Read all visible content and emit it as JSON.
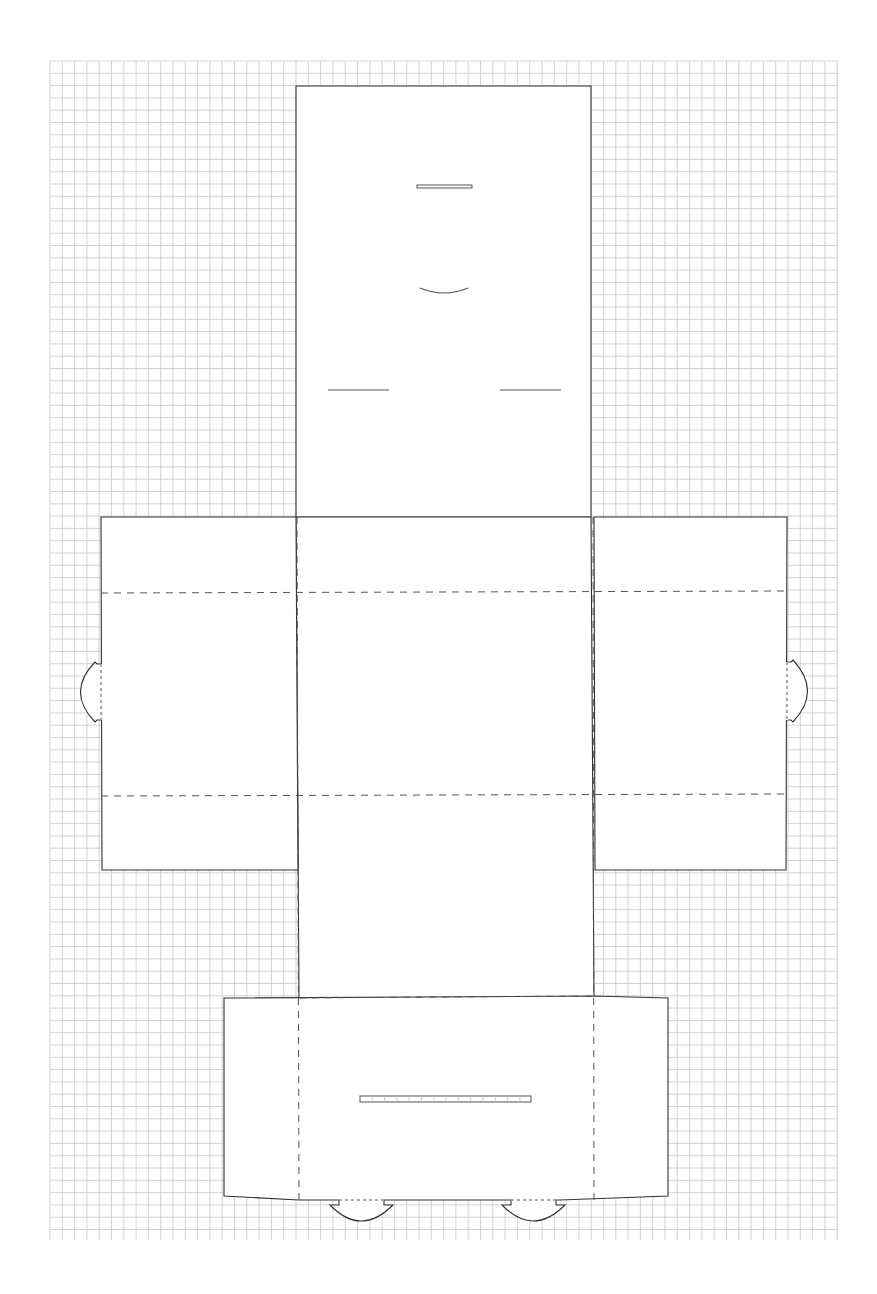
{
  "sheet": {
    "background": "#ffffff",
    "grid": {
      "x0": 50,
      "y0": 61,
      "x1": 838,
      "y1": 1240,
      "cell": 12.3,
      "color": "#c8c8c8"
    },
    "line_color": "#333333"
  },
  "die_line": {
    "panels": [
      {
        "name": "top-lid-panel",
        "points": "296,86 591,86 591,517 296,517"
      },
      {
        "name": "center-body-panel",
        "points": "296,517 591,517 594,998 299,998"
      },
      {
        "name": "left-side-panel",
        "points": "101,517 296,517 298,870 102,870"
      },
      {
        "name": "right-side-panel",
        "points": "594,517 787,517 786,870 595,870"
      },
      {
        "name": "bottom-front-panel",
        "points": "224,998 594,996 668,998 668,1196 560,1200 299,1200 224,1196"
      }
    ],
    "fold_lines": [
      {
        "name": "fold-left-upper",
        "x1": 101,
        "y1": 593,
        "x2": 787,
        "y2": 591
      },
      {
        "name": "fold-left-lower",
        "x1": 101,
        "y1": 796,
        "x2": 787,
        "y2": 794
      },
      {
        "name": "fold-center-left",
        "x1": 297,
        "y1": 517,
        "x2": 299,
        "y2": 1200
      },
      {
        "name": "fold-center-right",
        "x1": 593,
        "y1": 517,
        "x2": 594,
        "y2": 1200
      },
      {
        "name": "fold-bottom-top",
        "x1": 299,
        "y1": 998,
        "x2": 594,
        "y2": 996
      }
    ],
    "slots": [
      {
        "name": "top-slot",
        "x": 417,
        "y": 185,
        "w": 55,
        "h": 3
      },
      {
        "name": "bottom-slot",
        "x": 360,
        "y": 1096,
        "w": 171,
        "h": 6
      }
    ],
    "slits": [
      {
        "name": "slit-left",
        "x1": 328,
        "y1": 390,
        "x2": 389,
        "y2": 390
      },
      {
        "name": "slit-right",
        "x1": 500,
        "y1": 390,
        "x2": 561,
        "y2": 390
      }
    ],
    "curved_slit": {
      "name": "thumb-notch",
      "d": "M420,288 Q444,298 468,288"
    },
    "tabs": [
      {
        "name": "left-tab",
        "d": "M101,664 L97,664 L95,662 Q66,692 95,722 L97,720 L101,720"
      },
      {
        "name": "right-tab",
        "d": "M787,662 L791,662 L793,660 Q822,691 793,722 L791,720 L787,720"
      },
      {
        "name": "bottom-tab-left",
        "d": "M339,1200 L339,1205 L330,1205 Q361,1237 393,1205 L384,1205 L384,1200"
      },
      {
        "name": "bottom-tab-right",
        "d": "M511,1200 L511,1205 L502,1205 Q533,1237 565,1205 L556,1205 L556,1200"
      }
    ],
    "perforations": [
      {
        "name": "perf-tab-left",
        "x1": 101,
        "y1": 664,
        "x2": 101,
        "y2": 720
      },
      {
        "name": "perf-tab-right",
        "x1": 787,
        "y1": 662,
        "x2": 787,
        "y2": 720
      },
      {
        "name": "perf-bottom-tab-left",
        "x1": 339,
        "y1": 1200,
        "x2": 384,
        "y2": 1200
      },
      {
        "name": "perf-bottom-tab-right",
        "x1": 511,
        "y1": 1200,
        "x2": 556,
        "y2": 1200
      }
    ]
  }
}
